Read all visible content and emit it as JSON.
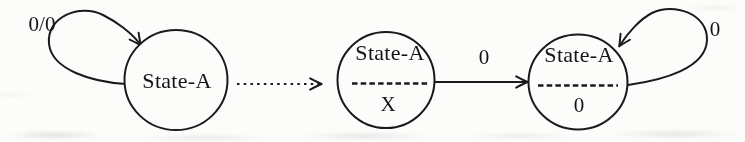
{
  "figure": {
    "type": "state-transition-diagram",
    "colors": {
      "ink": "#1a1a1a",
      "background": "#fcfcfb"
    },
    "states": [
      {
        "name": "left-state",
        "label": "State-A",
        "self_loop_label": "0/0",
        "loop_side": "upper-left"
      },
      {
        "name": "middle-state",
        "label": "State-A",
        "divider": "dashed",
        "output_label": "X"
      },
      {
        "name": "right-state",
        "label": "State-A",
        "divider": "dashed",
        "output_label": "0",
        "self_loop_label": "0",
        "loop_side": "upper-right"
      }
    ],
    "transitions": [
      {
        "name": "left-to-middle",
        "style": "dotted",
        "label": ""
      },
      {
        "name": "middle-to-right",
        "style": "solid",
        "label": "0"
      }
    ]
  }
}
